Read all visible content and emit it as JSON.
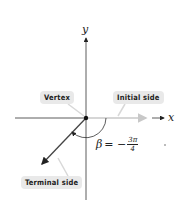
{
  "figure": {
    "axes": {
      "x_label": "x",
      "y_label": "y"
    },
    "labels": {
      "vertex": "Vertex",
      "initial_side": "Initial side",
      "terminal_side": "Terminal side"
    },
    "angle": {
      "symbol": "β",
      "equals": "= −",
      "numerator": "3π",
      "denominator": "4"
    },
    "colors": {
      "axis": "#333333",
      "terminal": "#444444",
      "initial": "#c8c8c8",
      "label_bg": "#e9e9e9"
    }
  }
}
